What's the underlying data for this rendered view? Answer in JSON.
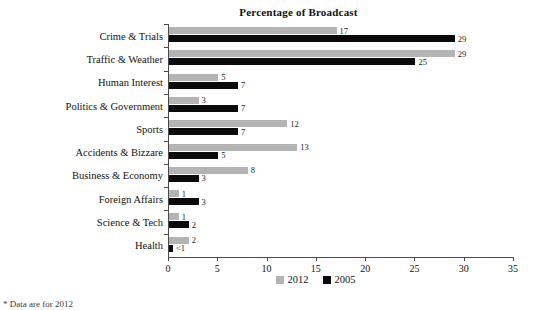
{
  "chart_data": {
    "type": "bar",
    "orientation": "horizontal",
    "title": "Percentage of Broadcast",
    "xlabel": "",
    "ylabel": "",
    "xlim": [
      0,
      35
    ],
    "xticks": [
      0,
      5,
      10,
      15,
      20,
      25,
      30,
      35
    ],
    "grid": false,
    "legend_position": "bottom-center",
    "categories": [
      "Crime & Trials",
      "Traffic & Weather",
      "Human Interest",
      "Politics & Government",
      "Sports",
      "Accidents & Bizzare",
      "Business & Economy",
      "Foreign Affairs",
      "Science & Tech",
      "Health"
    ],
    "series": [
      {
        "name": "2012",
        "color": "#b4b4b4",
        "values": [
          17,
          29,
          5,
          3,
          12,
          13,
          8,
          1,
          1,
          2
        ],
        "labels": [
          "17",
          "29",
          "5",
          "3",
          "12",
          "13",
          "8",
          "1",
          "1",
          "2"
        ]
      },
      {
        "name": "2005",
        "color": "#0a0a0a",
        "values": [
          29,
          25,
          7,
          7,
          7,
          5,
          3,
          3,
          2,
          0.4
        ],
        "labels": [
          "29",
          "25",
          "7",
          "7",
          "7",
          "5",
          "3",
          "3",
          "2",
          "<1"
        ]
      }
    ]
  },
  "legend": {
    "items": [
      {
        "label": "2012",
        "color": "#b4b4b4"
      },
      {
        "label": "2005",
        "color": "#0a0a0a"
      }
    ]
  },
  "footnote": {
    "mark": "*",
    "text": "Data are for 2012"
  }
}
